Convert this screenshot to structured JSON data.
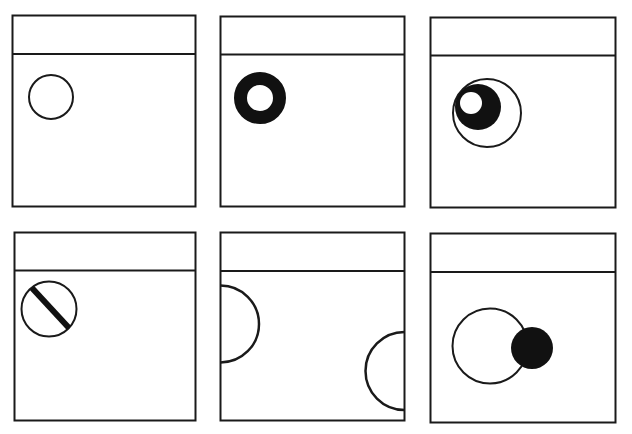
{
  "diagram": {
    "stroke_color": "#1a1a1a",
    "fill_color": "#111111",
    "background": "#ffffff",
    "panels": [
      {
        "id": 1,
        "variant": "open-circle"
      },
      {
        "id": 2,
        "variant": "filled-ring"
      },
      {
        "id": 3,
        "variant": "nested-eye-circle"
      },
      {
        "id": 4,
        "variant": "slashed-circle"
      },
      {
        "id": 5,
        "variant": "edge-half-circles"
      },
      {
        "id": 6,
        "variant": "overlapping-circles"
      }
    ]
  }
}
